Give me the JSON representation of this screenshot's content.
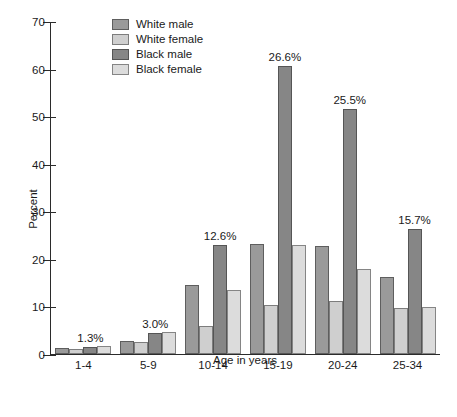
{
  "chart_data": {
    "type": "bar",
    "title": "",
    "xlabel": "Age in years",
    "ylabel": "Percent",
    "categories": [
      "1-4",
      "5-9",
      "10-14",
      "15-19",
      "20-24",
      "25-34"
    ],
    "series": [
      {
        "name": "White male",
        "key": "wm",
        "color": "#9a9a9a",
        "values": [
          1.3,
          2.7,
          14.5,
          23.2,
          22.7,
          16.2
        ]
      },
      {
        "name": "White female",
        "key": "wf",
        "color": "#cfcfcf",
        "values": [
          1.1,
          2.5,
          5.8,
          10.4,
          11.1,
          9.7
        ]
      },
      {
        "name": "Black male",
        "key": "bm",
        "color": "#868686",
        "values": [
          1.4,
          4.4,
          22.9,
          60.5,
          51.6,
          26.2
        ]
      },
      {
        "name": "Black female",
        "key": "bf",
        "color": "#dcdcdc",
        "values": [
          1.7,
          4.7,
          13.5,
          22.9,
          17.8,
          9.9
        ]
      }
    ],
    "ylim": [
      0,
      70
    ],
    "yticks": [
      0,
      10,
      20,
      30,
      40,
      50,
      60,
      70
    ],
    "ytick_labels": [
      "0",
      "10",
      "20",
      "30",
      "40",
      "50",
      "60",
      "70"
    ],
    "grid": false,
    "legend_position": "top-left-inside",
    "annotations": [
      {
        "category": "1-4",
        "series": "Black male",
        "text": "1.3%"
      },
      {
        "category": "5-9",
        "series": "Black male",
        "text": "3.0%"
      },
      {
        "category": "10-14",
        "series": "Black male",
        "text": "12.6%"
      },
      {
        "category": "15-19",
        "series": "Black male",
        "text": "26.6%"
      },
      {
        "category": "20-24",
        "series": "Black male",
        "text": "25.5%"
      },
      {
        "category": "25-34",
        "series": "Black male",
        "text": "15.7%"
      }
    ]
  },
  "axes": {
    "y_title": "Percent",
    "x_title": "Age in years",
    "y_tick_0": "0",
    "y_tick_1": "10",
    "y_tick_2": "20",
    "y_tick_3": "30",
    "y_tick_4": "40",
    "y_tick_5": "50",
    "y_tick_6": "60",
    "y_tick_7": "70"
  },
  "legend": {
    "items": [
      {
        "label": "White male"
      },
      {
        "label": "White female"
      },
      {
        "label": "Black male"
      },
      {
        "label": "Black female"
      }
    ]
  },
  "groups": [
    {
      "label": "1-4",
      "annotation": "1.3%"
    },
    {
      "label": "5-9",
      "annotation": "3.0%"
    },
    {
      "label": "10-14",
      "annotation": "12.6%"
    },
    {
      "label": "15-19",
      "annotation": "26.6%"
    },
    {
      "label": "20-24",
      "annotation": "25.5%"
    },
    {
      "label": "25-34",
      "annotation": "15.7%"
    }
  ]
}
